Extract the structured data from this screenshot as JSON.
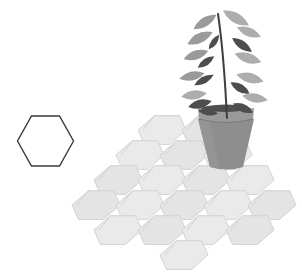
{
  "canvas": {
    "width": 302,
    "height": 275,
    "background": "#ffffff",
    "title": "Hexagonal tile floor with potted plant"
  },
  "palette": {
    "tile_fill": "#eaeaea",
    "tile_fill_alt": "#e4e4e4",
    "tile_stroke": "#d3d3d3",
    "tile_edge_shadow": "#d8d8d8",
    "outline_hex_stroke": "#3b3b3b",
    "outline_hex_fill": "#ffffff",
    "pot_body": "#8e8e8e",
    "pot_body_light": "#9b9b9b",
    "pot_rim": "#9a9a9a",
    "pot_shadow": "#7a7a7a",
    "soil": "#4f4f4f",
    "stem": "#3f3f3f",
    "leaf_light": "#adadad",
    "leaf_mid": "#9a9a9a",
    "leaf_dark": "#4d4d4d"
  },
  "legend_hex": {
    "label": "outline-hexagon",
    "center_x": 45.5,
    "center_y": 141,
    "radius": 28,
    "orientation": "flat-top",
    "stroke_width": 1.4
  },
  "tile_field": {
    "label": "hexagonal-floor",
    "hex_radius": 24,
    "orientation": "pointy-side",
    "shear": -0.22,
    "tile_count": 19,
    "tiles": [
      {
        "id": "r0c0",
        "cx": 162,
        "cy": 130,
        "row": 0,
        "col": 0
      },
      {
        "id": "r0c1",
        "cx": 206,
        "cy": 130,
        "row": 0,
        "col": 1
      },
      {
        "id": "r1c0",
        "cx": 140,
        "cy": 155,
        "row": 1,
        "col": 0
      },
      {
        "id": "r1c1",
        "cx": 184,
        "cy": 155,
        "row": 1,
        "col": 1
      },
      {
        "id": "r1c2",
        "cx": 228,
        "cy": 155,
        "row": 1,
        "col": 2
      },
      {
        "id": "r2c0",
        "cx": 118,
        "cy": 180,
        "row": 2,
        "col": 0
      },
      {
        "id": "r2c1",
        "cx": 162,
        "cy": 180,
        "row": 2,
        "col": 1
      },
      {
        "id": "r2c2",
        "cx": 206,
        "cy": 180,
        "row": 2,
        "col": 2
      },
      {
        "id": "r2c3",
        "cx": 250,
        "cy": 180,
        "row": 2,
        "col": 3
      },
      {
        "id": "r3c0",
        "cx": 96,
        "cy": 205,
        "row": 3,
        "col": 0
      },
      {
        "id": "r3c1",
        "cx": 140,
        "cy": 205,
        "row": 3,
        "col": 1
      },
      {
        "id": "r3c2",
        "cx": 184,
        "cy": 205,
        "row": 3,
        "col": 2
      },
      {
        "id": "r3c3",
        "cx": 228,
        "cy": 205,
        "row": 3,
        "col": 3
      },
      {
        "id": "r3c4",
        "cx": 272,
        "cy": 205,
        "row": 3,
        "col": 4
      },
      {
        "id": "r4c0",
        "cx": 118,
        "cy": 230,
        "row": 4,
        "col": 0
      },
      {
        "id": "r4c1",
        "cx": 162,
        "cy": 230,
        "row": 4,
        "col": 1
      },
      {
        "id": "r4c2",
        "cx": 206,
        "cy": 230,
        "row": 4,
        "col": 2
      },
      {
        "id": "r4c3",
        "cx": 250,
        "cy": 230,
        "row": 4,
        "col": 3
      },
      {
        "id": "r5c0",
        "cx": 184,
        "cy": 255,
        "row": 5,
        "col": 0
      }
    ]
  },
  "plant": {
    "label": "potted-plant",
    "pot": {
      "label": "flower-pot",
      "rim_left_x": 198,
      "rim_right_x": 254,
      "rim_top_y": 108,
      "rim_height": 11,
      "base_left_x": 210,
      "base_right_x": 243,
      "base_y": 167
    },
    "soil": {
      "label": "soil-mound"
    },
    "stem": {
      "label": "plant-stem",
      "base_x": 227,
      "base_y": 118,
      "tip_x": 218,
      "tip_y": 14
    },
    "leaf_count": 18,
    "leaves": [
      {
        "i": 0,
        "cx": 205,
        "cy": 22,
        "len": 27,
        "wid": 9,
        "rot": -32,
        "tone": "light"
      },
      {
        "i": 1,
        "cx": 236,
        "cy": 18,
        "len": 30,
        "wid": 10,
        "rot": 30,
        "tone": "light"
      },
      {
        "i": 2,
        "cx": 249,
        "cy": 32,
        "len": 26,
        "wid": 9,
        "rot": 22,
        "tone": "light"
      },
      {
        "i": 3,
        "cx": 200,
        "cy": 38,
        "len": 28,
        "wid": 10,
        "rot": -25,
        "tone": "light"
      },
      {
        "i": 4,
        "cx": 214,
        "cy": 42,
        "len": 18,
        "wid": 6,
        "rot": -55,
        "tone": "dark"
      },
      {
        "i": 5,
        "cx": 242,
        "cy": 45,
        "len": 24,
        "wid": 8,
        "rot": 35,
        "tone": "dark"
      },
      {
        "i": 6,
        "cx": 196,
        "cy": 55,
        "len": 26,
        "wid": 9,
        "rot": -18,
        "tone": "light"
      },
      {
        "i": 7,
        "cx": 248,
        "cy": 58,
        "len": 28,
        "wid": 10,
        "rot": 18,
        "tone": "light"
      },
      {
        "i": 8,
        "cx": 206,
        "cy": 62,
        "len": 20,
        "wid": 7,
        "rot": -35,
        "tone": "dark"
      },
      {
        "i": 9,
        "cx": 192,
        "cy": 76,
        "len": 26,
        "wid": 9,
        "rot": -12,
        "tone": "light"
      },
      {
        "i": 10,
        "cx": 204,
        "cy": 80,
        "len": 22,
        "wid": 7,
        "rot": -28,
        "tone": "dark"
      },
      {
        "i": 11,
        "cx": 250,
        "cy": 78,
        "len": 28,
        "wid": 10,
        "rot": 14,
        "tone": "light"
      },
      {
        "i": 12,
        "cx": 240,
        "cy": 88,
        "len": 22,
        "wid": 8,
        "rot": 30,
        "tone": "dark"
      },
      {
        "i": 13,
        "cx": 194,
        "cy": 95,
        "len": 26,
        "wid": 9,
        "rot": -8,
        "tone": "light"
      },
      {
        "i": 14,
        "cx": 255,
        "cy": 98,
        "len": 26,
        "wid": 9,
        "rot": 10,
        "tone": "light"
      },
      {
        "i": 15,
        "cx": 200,
        "cy": 104,
        "len": 24,
        "wid": 9,
        "rot": -14,
        "tone": "dark"
      },
      {
        "i": 16,
        "cx": 243,
        "cy": 108,
        "len": 22,
        "wid": 8,
        "rot": 24,
        "tone": "dark"
      },
      {
        "i": 17,
        "cx": 208,
        "cy": 112,
        "len": 20,
        "wid": 7,
        "rot": 8,
        "tone": "dark"
      }
    ]
  }
}
